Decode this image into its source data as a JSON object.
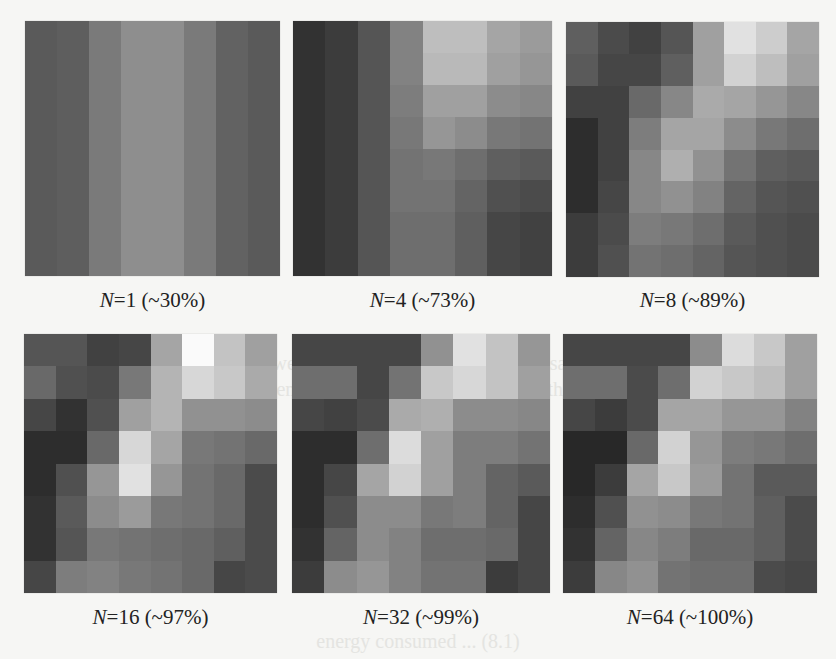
{
  "figure": {
    "ghost_text": [
      "In Fig. 8.3, we present the results of using the same number",
      "of measurements from each method, where the original",
      "energy consumed ... (8.1)"
    ],
    "panels": [
      {
        "n_label": "N",
        "eq": "=",
        "n_value": "1",
        "percent_label": "(~30%)",
        "grid": [
          [
            90,
            94,
            122,
            142,
            142,
            122,
            98,
            90
          ],
          [
            90,
            94,
            122,
            142,
            142,
            122,
            98,
            90
          ],
          [
            90,
            94,
            122,
            142,
            142,
            122,
            98,
            90
          ],
          [
            90,
            94,
            122,
            142,
            142,
            122,
            98,
            90
          ],
          [
            90,
            94,
            122,
            142,
            142,
            122,
            98,
            90
          ],
          [
            90,
            94,
            122,
            142,
            142,
            122,
            98,
            90
          ],
          [
            90,
            94,
            122,
            142,
            142,
            122,
            98,
            90
          ],
          [
            90,
            94,
            122,
            142,
            142,
            122,
            98,
            90
          ]
        ]
      },
      {
        "n_label": "N",
        "eq": "=",
        "n_value": "4",
        "percent_label": "(~73%)",
        "grid": [
          [
            50,
            60,
            85,
            130,
            190,
            190,
            165,
            155
          ],
          [
            50,
            60,
            85,
            130,
            185,
            185,
            160,
            150
          ],
          [
            50,
            60,
            85,
            125,
            160,
            160,
            140,
            135
          ],
          [
            50,
            60,
            85,
            120,
            150,
            140,
            120,
            115
          ],
          [
            50,
            60,
            85,
            115,
            120,
            110,
            95,
            90
          ],
          [
            50,
            60,
            85,
            115,
            115,
            100,
            80,
            75
          ],
          [
            50,
            60,
            85,
            110,
            110,
            95,
            70,
            65
          ],
          [
            50,
            60,
            85,
            110,
            110,
            95,
            70,
            65
          ]
        ]
      },
      {
        "n_label": "N",
        "eq": "=",
        "n_value": "8",
        "percent_label": "(~89%)",
        "grid": [
          [
            95,
            75,
            65,
            85,
            160,
            225,
            205,
            165
          ],
          [
            90,
            70,
            70,
            95,
            160,
            210,
            190,
            160
          ],
          [
            65,
            65,
            105,
            135,
            170,
            165,
            150,
            135
          ],
          [
            45,
            65,
            125,
            165,
            165,
            140,
            120,
            110
          ],
          [
            45,
            65,
            135,
            175,
            145,
            115,
            95,
            90
          ],
          [
            45,
            70,
            135,
            145,
            130,
            100,
            85,
            80
          ],
          [
            60,
            75,
            125,
            120,
            110,
            90,
            80,
            75
          ],
          [
            60,
            80,
            115,
            110,
            100,
            85,
            80,
            75
          ]
        ]
      },
      {
        "n_label": "N",
        "eq": "=",
        "n_value": "16",
        "percent_label": "(~97%)",
        "grid": [
          [
            85,
            85,
            65,
            70,
            165,
            250,
            195,
            160
          ],
          [
            105,
            80,
            75,
            120,
            180,
            215,
            200,
            170
          ],
          [
            70,
            50,
            80,
            160,
            180,
            145,
            145,
            140
          ],
          [
            45,
            45,
            105,
            215,
            165,
            120,
            115,
            105
          ],
          [
            45,
            80,
            150,
            225,
            150,
            115,
            105,
            75
          ],
          [
            50,
            90,
            140,
            155,
            120,
            115,
            105,
            75
          ],
          [
            50,
            85,
            120,
            115,
            110,
            105,
            95,
            75
          ],
          [
            70,
            125,
            130,
            120,
            115,
            105,
            70,
            75
          ]
        ]
      },
      {
        "n_label": "N",
        "eq": "=",
        "n_value": "32",
        "percent_label": "(~99%)",
        "grid": [
          [
            70,
            70,
            70,
            70,
            145,
            225,
            195,
            150
          ],
          [
            110,
            110,
            70,
            115,
            200,
            215,
            195,
            160
          ],
          [
            70,
            65,
            75,
            170,
            175,
            140,
            140,
            135
          ],
          [
            45,
            45,
            110,
            220,
            160,
            125,
            125,
            115
          ],
          [
            45,
            70,
            165,
            210,
            160,
            125,
            100,
            90
          ],
          [
            45,
            80,
            140,
            140,
            120,
            125,
            100,
            70
          ],
          [
            50,
            100,
            140,
            130,
            110,
            110,
            105,
            70
          ],
          [
            60,
            140,
            150,
            130,
            115,
            115,
            60,
            70
          ]
        ]
      },
      {
        "n_label": "N",
        "eq": "=",
        "n_value": "64",
        "percent_label": "(~100%)",
        "grid": [
          [
            70,
            70,
            70,
            70,
            140,
            220,
            200,
            160
          ],
          [
            110,
            110,
            75,
            110,
            210,
            200,
            190,
            160
          ],
          [
            70,
            60,
            75,
            165,
            165,
            150,
            150,
            130
          ],
          [
            40,
            40,
            105,
            210,
            150,
            125,
            120,
            110
          ],
          [
            40,
            60,
            165,
            200,
            155,
            115,
            90,
            90
          ],
          [
            45,
            80,
            145,
            140,
            120,
            115,
            95,
            75
          ],
          [
            50,
            100,
            135,
            125,
            105,
            105,
            95,
            75
          ],
          [
            60,
            135,
            145,
            115,
            110,
            110,
            75,
            70
          ]
        ]
      }
    ]
  },
  "chart_data": {
    "type": "heatmap",
    "title": "",
    "layout": "2 rows x 3 columns of 8x8 grayscale grids",
    "colormap": "gray (0=black, 255=white)",
    "captions": [
      "N=1 (~30%)",
      "N=4 (~73%)",
      "N=8 (~89%)",
      "N=16 (~97%)",
      "N=32 (~99%)",
      "N=64 (~100%)"
    ],
    "series": [
      {
        "name": "N=1",
        "percent": "~30%"
      },
      {
        "name": "N=4",
        "percent": "~73%"
      },
      {
        "name": "N=8",
        "percent": "~89%"
      },
      {
        "name": "N=16",
        "percent": "~97%"
      },
      {
        "name": "N=32",
        "percent": "~99%"
      },
      {
        "name": "N=64",
        "percent": "~100%"
      }
    ]
  }
}
